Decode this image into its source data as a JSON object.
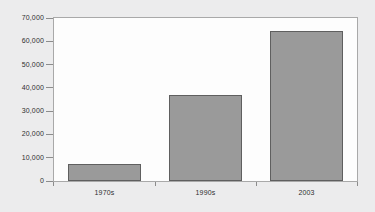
{
  "chart_data": {
    "type": "bar",
    "title": "",
    "subtitle": "",
    "xlabel": "",
    "ylabel": "",
    "categories": [
      "1970s",
      "1990s",
      "2003"
    ],
    "values": [
      7300,
      37000,
      64400
    ],
    "series": [
      {
        "name": "",
        "values": [
          7300,
          37000,
          64400
        ]
      }
    ],
    "ylim": [
      0,
      70000
    ],
    "yticks": [
      0,
      10000,
      20000,
      30000,
      40000,
      50000,
      60000,
      70000
    ],
    "ytick_labels": [
      "0",
      "10,000",
      "20,000",
      "30,000",
      "40,000",
      "50,000",
      "60,000",
      "70,000"
    ],
    "grid": false,
    "legend": false,
    "legend_position": "none",
    "annotations": [],
    "colors": {
      "bar_fill": "#9a9a9a",
      "bar_border": "#5f5f5f",
      "plot_background": "#fdfdfd",
      "page_background": "#ececed",
      "frame_border": "#a9a9a9",
      "axis_text": "#2f2f2f",
      "tick_mark": "#8c8c8c"
    }
  }
}
